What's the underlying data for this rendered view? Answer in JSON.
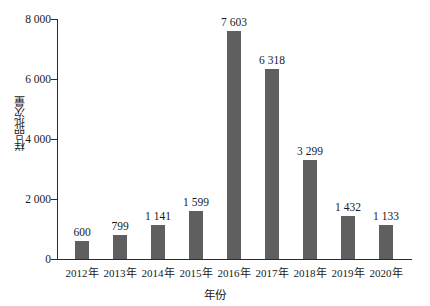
{
  "chart_data": {
    "type": "bar",
    "title": "",
    "xlabel": "年份",
    "ylabel": "样品批次量",
    "categories": [
      "2012年",
      "2013年",
      "2014年",
      "2015年",
      "2016年",
      "2017年",
      "2018年",
      "2019年",
      "2020年"
    ],
    "values": [
      600,
      799,
      1141,
      1599,
      7603,
      6318,
      3299,
      1432,
      1133
    ],
    "value_labels": [
      "600",
      "799",
      "1 141",
      "1 599",
      "7 603",
      "6 318",
      "3 299",
      "1 432",
      "1 133"
    ],
    "ylim": [
      0,
      8000
    ],
    "yticks": [
      0,
      2000,
      4000,
      6000,
      8000
    ],
    "ytick_labels": [
      "0",
      "2 000",
      "4 000",
      "6 000",
      "8 000"
    ],
    "grid": false,
    "legend": null,
    "bar_color": "#5f5f5f",
    "axis_color": "#2b2b2b",
    "background": "#ffffff"
  }
}
